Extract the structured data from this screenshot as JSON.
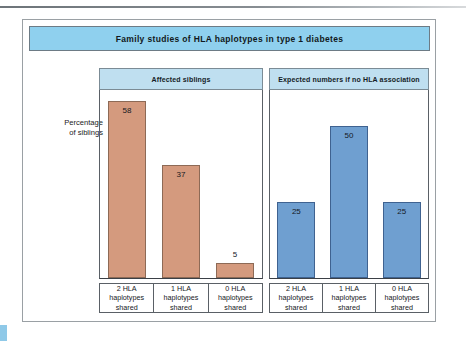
{
  "figure": {
    "title": "Family studies of HLA haplotypes in type 1 diabetes",
    "y_axis_caption_line1": "Percentage",
    "y_axis_caption_line2": "of siblings"
  },
  "colors": {
    "title_bar": "#8fd0ee",
    "group_header": "#bfdff0",
    "bar_affected": "#d49a7e",
    "bar_expected": "#6f9fd0",
    "frame": "#9aa0a4",
    "axis": "#3b4046"
  },
  "chart_data": {
    "type": "bar",
    "title": "Family studies of HLA haplotypes in type 1 diabetes",
    "xlabel": "",
    "ylabel": "Percentage of siblings",
    "ylim": [
      0,
      62
    ],
    "grid": false,
    "legend": "none",
    "groups": [
      {
        "name": "Affected siblings",
        "color": "#d49a7e",
        "categories": [
          "2 HLA haplotypes shared",
          "1 HLA haplotypes shared",
          "0 HLA haplotypes shared"
        ],
        "values": [
          58,
          37,
          5
        ],
        "label_positions": [
          "inside",
          "inside",
          "outside"
        ]
      },
      {
        "name": "Expected numbers if no HLA association",
        "color": "#6f9fd0",
        "categories": [
          "2 HLA haplotypes shared",
          "1 HLA haplotypes shared",
          "0 HLA haplotypes shared"
        ],
        "values": [
          25,
          50,
          25
        ],
        "label_positions": [
          "inside",
          "inside",
          "inside"
        ]
      }
    ],
    "category_label_lines": [
      [
        "2 HLA",
        "haplotypes",
        "shared"
      ],
      [
        "1 HLA",
        "haplotypes",
        "shared"
      ],
      [
        "0 HLA",
        "haplotypes",
        "shared"
      ]
    ],
    "value_labels": {
      "affected": [
        "58",
        "37",
        "5"
      ],
      "expected": [
        "25",
        "50",
        "25"
      ]
    }
  }
}
